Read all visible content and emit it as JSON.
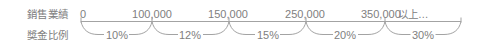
{
  "row_labels": {
    "sales": "銷售業績",
    "bonus": "獎金比例"
  },
  "thresholds": [
    "0",
    "100,000",
    "150,000",
    "250,000",
    "350,000"
  ],
  "threshold_suffix": "以上…",
  "rates": [
    "10%",
    "12%",
    "15%",
    "20%",
    "30%"
  ],
  "tiers": [
    {
      "from": "0",
      "to": "100,000",
      "rate": "10%"
    },
    {
      "from": "100,000",
      "to": "150,000",
      "rate": "12%"
    },
    {
      "from": "150,000",
      "to": "250,000",
      "rate": "15%"
    },
    {
      "from": "250,000",
      "to": "350,000",
      "rate": "20%"
    },
    {
      "from": "350,000",
      "to": "以上…",
      "rate": "30%"
    }
  ],
  "colors": {
    "text": "#808080",
    "line": "#a3a3a3"
  }
}
